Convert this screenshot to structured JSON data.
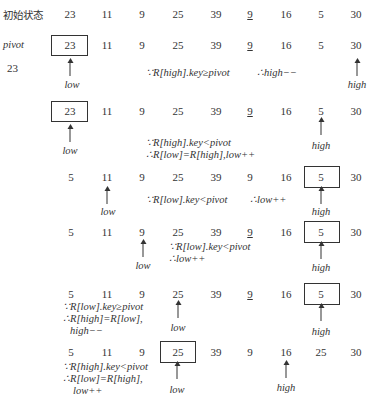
{
  "rows": [
    {
      "label": "初始状态",
      "values": [
        "23",
        "11",
        "9",
        "25",
        "39",
        "9",
        "16",
        "5",
        "30"
      ]
    },
    {
      "label": "pivot",
      "values": [
        "23",
        "11",
        "9",
        "25",
        "39",
        "9",
        "16",
        "5",
        "30"
      ]
    },
    {
      "values": [
        "23",
        "11",
        "9",
        "25",
        "39",
        "9",
        "16",
        "5",
        "30"
      ]
    },
    {
      "values": [
        "5",
        "11",
        "9",
        "25",
        "39",
        "9",
        "16",
        "5",
        "30"
      ]
    },
    {
      "values": [
        "5",
        "11",
        "9",
        "25",
        "39",
        "9",
        "16",
        "5",
        "30"
      ]
    },
    {
      "values": [
        "5",
        "11",
        "9",
        "25",
        "39",
        "9",
        "16",
        "5",
        "30"
      ]
    },
    {
      "values": [
        "5",
        "11",
        "9",
        "25",
        "39",
        "9",
        "16",
        "25",
        "30"
      ]
    }
  ],
  "pivot_value": "23",
  "pointers": {
    "low": "low",
    "high": "high"
  },
  "notes": {
    "n1a": "∵R[high].key≥pivot",
    "n1b": "∴high−−",
    "n2a": "∵R[high].key<pivot",
    "n2b": "∴R[low]=R[high],low++",
    "n3a": "∵R[low].key<pivot",
    "n3b": "∴low++",
    "n4a": "∵R[low].key<pivot",
    "n4b": "∴low++",
    "n5a": "∵R[low].key≥pivot",
    "n5b": "∴R[high]=R[low],",
    "n5c": "high−−",
    "n6a": "∵R[high].key<pivot",
    "n6b": "∴R[low]=R[high],",
    "n6c": "low++"
  }
}
